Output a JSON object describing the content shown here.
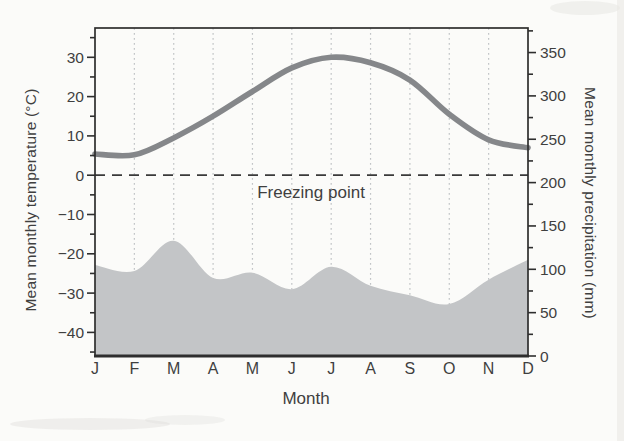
{
  "style": {
    "paper": "#fbfbf9",
    "ink": "#3f3f3f",
    "axis_line": "#2e2e2e",
    "gridline": "#c1c4c6",
    "temperature_line": "#85878a",
    "precipitation_fill": "#c3c5c7",
    "freezing_dash": "#3a3a3a"
  },
  "chart_data": {
    "type": "climograph (temperature line + precipitation area)",
    "x": {
      "label": "Month",
      "categories": [
        "J",
        "F",
        "M",
        "A",
        "M",
        "J",
        "J",
        "A",
        "S",
        "O",
        "N",
        "D"
      ]
    },
    "y_left": {
      "label": "Mean monthly temperature (°C)",
      "major_ticks": [
        30,
        20,
        10,
        0,
        -10,
        -20,
        -30,
        -40
      ],
      "major_tick_labels": [
        "30",
        "20",
        "10",
        "0",
        "−10",
        "−20",
        "−30",
        "−40"
      ],
      "minor_tick_values": [
        35,
        25,
        15,
        5,
        -5,
        -15,
        -25,
        -35,
        -45
      ],
      "range": [
        -46,
        37.4
      ]
    },
    "y_right": {
      "label": "Mean monthly precipitation (mm)",
      "major_ticks": [
        350,
        300,
        250,
        200,
        150,
        100,
        50,
        0
      ],
      "major_tick_labels": [
        "350",
        "300",
        "250",
        "200",
        "150",
        "100",
        "50",
        "0"
      ],
      "minor_tick_values": [
        375,
        325,
        275,
        225,
        175,
        125,
        75,
        25
      ],
      "range": [
        0,
        378
      ]
    },
    "grid": "vertical dotted gridlines at each month",
    "legend": "none",
    "annotations": [
      {
        "text": "Freezing point",
        "axis": "left",
        "value": 0,
        "line_style": "dashed"
      }
    ],
    "series": [
      {
        "name": "Mean monthly temperature",
        "type": "line",
        "axis": "left",
        "unit": "°C",
        "values": [
          5.4,
          5.2,
          9.5,
          15,
          21.3,
          27.3,
          30,
          28.6,
          24.2,
          15.5,
          9,
          7
        ]
      },
      {
        "name": "Mean monthly precipitation",
        "type": "area",
        "axis": "right",
        "unit": "mm",
        "values": [
          105,
          98,
          133,
          90,
          96,
          77,
          103,
          81,
          70,
          60,
          88,
          111
        ]
      }
    ]
  }
}
